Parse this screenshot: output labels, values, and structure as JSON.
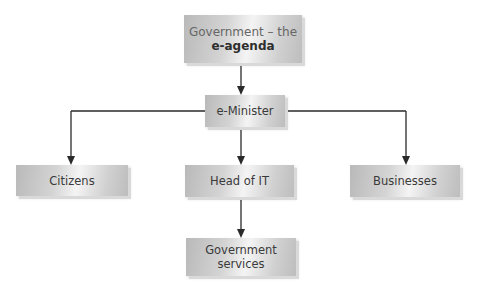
{
  "diagram": {
    "type": "hierarchy",
    "nodes": {
      "root": {
        "line1": "Government – the",
        "line2": "e-agenda"
      },
      "minister": {
        "label": "e-Minister"
      },
      "citizens": {
        "label": "Citizens"
      },
      "head_it": {
        "label": "Head of IT"
      },
      "businesses": {
        "label": "Businesses"
      },
      "gov_services": {
        "line1": "Government",
        "line2": "services"
      }
    },
    "edges": [
      {
        "from": "Government – the e-agenda",
        "to": "e-Minister"
      },
      {
        "from": "e-Minister",
        "to": "Citizens"
      },
      {
        "from": "e-Minister",
        "to": "Head of IT"
      },
      {
        "from": "e-Minister",
        "to": "Businesses"
      },
      {
        "from": "Head of IT",
        "to": "Government services"
      }
    ],
    "colors": {
      "line": "#2a2a2a",
      "box_mid": "#f4f4f4",
      "box_edge": "#b9b9b9",
      "text": "#3a3a3a"
    }
  }
}
